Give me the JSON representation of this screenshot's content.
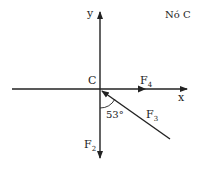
{
  "title": "Nó C",
  "node_label": "C",
  "axes": {
    "x": "x",
    "y": "y"
  },
  "forces": [
    {
      "name": "F",
      "sub": "4",
      "direction": "+x"
    },
    {
      "name": "F",
      "sub": "3",
      "direction": "down-right"
    },
    {
      "name": "F",
      "sub": "2",
      "direction": "-y"
    }
  ],
  "angle": {
    "value": "53°",
    "between": [
      "F2",
      "F3"
    ]
  },
  "colors": {
    "line": "#222222",
    "background": "#ffffff"
  }
}
